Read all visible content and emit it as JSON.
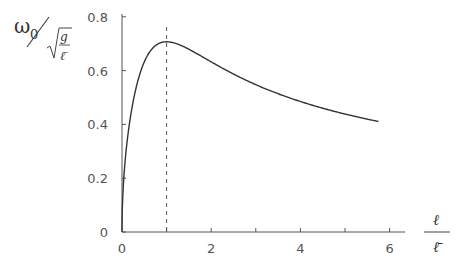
{
  "chart_data": {
    "type": "line",
    "title": "",
    "xlabel": "ℓ / ℓ̄",
    "ylabel": "ω0 / √(g/ℓ̄)",
    "ylabel_parts": {
      "numerator": "ω",
      "subscript": "0",
      "sqrt_num": "g",
      "sqrt_den": "ℓ̄"
    },
    "xlabel_parts": {
      "numerator": "ℓ",
      "denominator": "ℓ̄"
    },
    "xlim": [
      0,
      6.3
    ],
    "ylim": [
      0,
      0.8
    ],
    "x_ticks": [
      0,
      1,
      2,
      3,
      4,
      5,
      6
    ],
    "x_tick_labels": [
      "0",
      "",
      "2",
      "",
      "4",
      "",
      "6"
    ],
    "y_ticks": [
      0,
      0.2,
      0.4,
      0.6,
      0.8
    ],
    "y_tick_labels": [
      "0",
      "0.2",
      "0.4",
      "0.6",
      "0.8"
    ],
    "grid": false,
    "legend": null,
    "annotations": [
      {
        "type": "vline-dashed",
        "x": 1,
        "label": "maximum at ℓ = ℓ̄, value ≈ 0.707"
      }
    ],
    "series": [
      {
        "name": "ω0/√(g/ℓ̄) = √(x/(1+x²))",
        "x": [
          0,
          0.05,
          0.1,
          0.2,
          0.3,
          0.4,
          0.5,
          0.6,
          0.7,
          0.8,
          0.9,
          1.0,
          1.25,
          1.5,
          1.75,
          2.0,
          2.5,
          3.0,
          3.5,
          4.0,
          4.5,
          5.0,
          5.5,
          5.75
        ],
        "values": [
          0,
          0.223,
          0.315,
          0.439,
          0.525,
          0.587,
          0.632,
          0.664,
          0.686,
          0.699,
          0.705,
          0.707,
          0.698,
          0.679,
          0.657,
          0.632,
          0.587,
          0.548,
          0.514,
          0.485,
          0.46,
          0.439,
          0.42,
          0.411
        ]
      }
    ],
    "color": "#333333",
    "dash_color": "#555555"
  }
}
